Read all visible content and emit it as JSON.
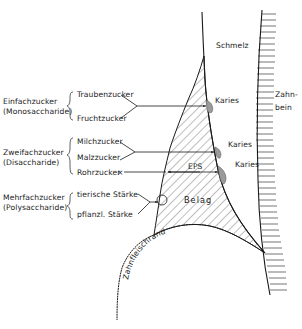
{
  "diagram": {
    "labels": {
      "enamel": "Schmelz",
      "dentin_line1": "Zahn-",
      "dentin_line2": "bein",
      "plaque": "Belag",
      "gum_margin": "Zahnfleischrand",
      "eps": "EPS",
      "caries": "Karies"
    },
    "groups": [
      {
        "name": "Einfachzucker",
        "latin": "(Monosaccharide)",
        "items": [
          "Traubenzucker",
          "Fruchtzucker"
        ]
      },
      {
        "name": "Zweifachzucker",
        "latin": "(Disaccharide)",
        "items": [
          "Milchzucker",
          "Malzzucker",
          "Rohrzucker"
        ]
      },
      {
        "name": "Mehrfachzucker",
        "latin": "(Polysaccharide)",
        "items": [
          "tierische Stärke",
          "pflanzl. Stärke"
        ]
      }
    ],
    "colors": {
      "line": "#1a1a1a",
      "caries_fill": "#9a9a9a",
      "hatch": "#444444",
      "background": "#ffffff"
    }
  }
}
